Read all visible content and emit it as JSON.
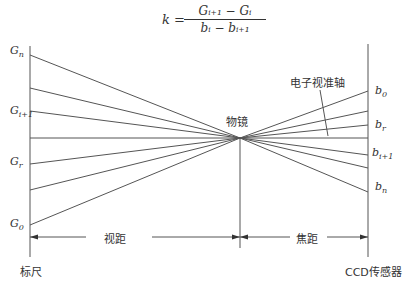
{
  "formula": {
    "lhs": "k =",
    "numerator": "Gᵢ₊₁ − Gᵢ",
    "denominator": "bᵢ − bᵢ₊₁"
  },
  "left_labels": {
    "g_n": "Gn",
    "g_i1": "Gi+1",
    "g_r": "Gr",
    "g_0": "G0"
  },
  "right_labels": {
    "b_0": "b0",
    "b_r": "br",
    "b_i1": "bi+1",
    "b_n": "bn"
  },
  "annotations": {
    "lens": "物镜",
    "axis": "电子视准轴",
    "view_distance": "视距",
    "focal_distance": "焦距",
    "staff": "标尺",
    "sensor": "CCD传感器"
  }
}
